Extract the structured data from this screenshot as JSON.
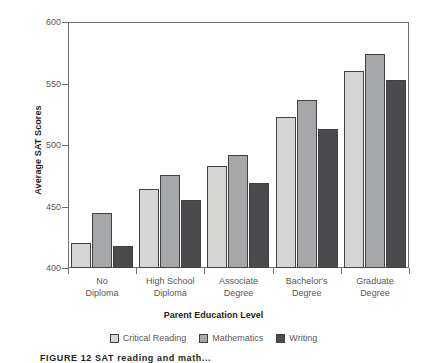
{
  "chart_data": {
    "type": "bar",
    "title": "",
    "xlabel": "Parent Education Level",
    "ylabel": "Average SAT Scores",
    "ylim": [
      400,
      600
    ],
    "yticks": [
      400,
      450,
      500,
      550,
      600
    ],
    "grid": false,
    "legend_position": "bottom",
    "categories": [
      "No\nDiploma",
      "High School\nDiploma",
      "Associate\nDegree",
      "Bachelor's\nDegree",
      "Graduate\nDegree"
    ],
    "category_lines": [
      [
        "No",
        "Diploma"
      ],
      [
        "High School",
        "Diploma"
      ],
      [
        "Associate",
        "Degree"
      ],
      [
        "Bachelor's",
        "Degree"
      ],
      [
        "Graduate",
        "Degree"
      ]
    ],
    "series": [
      {
        "name": "Critical Reading",
        "color": "#d5d5d4",
        "values": [
          420,
          464,
          483,
          523,
          560
        ]
      },
      {
        "name": "Mathematics",
        "color": "#a6a7a8",
        "values": [
          445,
          476,
          492,
          537,
          574
        ]
      },
      {
        "name": "Writing",
        "color": "#4b4b4d",
        "values": [
          418,
          455,
          469,
          513,
          553
        ]
      }
    ]
  },
  "axis": {
    "y_title": "Average SAT Scores",
    "x_title": "Parent Education Level",
    "y_tick_labels": [
      "600",
      "550",
      "500",
      "450",
      "400"
    ]
  },
  "legend": {
    "items": [
      {
        "label": "Critical Reading"
      },
      {
        "label": "Mathematics"
      },
      {
        "label": "Writing"
      }
    ]
  },
  "caption": {
    "text": "FIGURE 12  SAT reading and math..."
  }
}
